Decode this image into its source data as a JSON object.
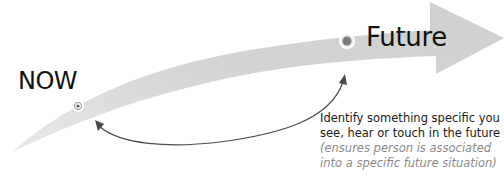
{
  "diagram": {
    "labels": {
      "now": "NOW",
      "future": "Future"
    },
    "caption": {
      "line1": "Identify something specific you",
      "line2": "see, hear or touch in the future",
      "note1": "(ensures person is associated",
      "note2": "into a specific future situation)"
    },
    "colors": {
      "arrow_fill": "#d6d6d6",
      "connector": "#4a4a4a",
      "marker_dot": "#7a7a7a",
      "text": "#111111",
      "note_text": "#8a8a8a"
    }
  }
}
